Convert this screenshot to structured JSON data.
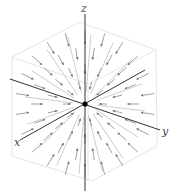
{
  "figure": {
    "type": "3d-vector-field",
    "colors": {
      "background": "#ffffff",
      "axis": "#333333",
      "box": "#dddddd",
      "arrow": "#777777",
      "origin": "#000000"
    },
    "axes": {
      "x": {
        "label": "x",
        "from": [
          145,
          70
        ],
        "to": [
          20,
          140
        ],
        "label_pos": [
          14,
          137
        ]
      },
      "y": {
        "label": "y",
        "from": [
          10,
          79
        ],
        "to": [
          160,
          130
        ],
        "label_pos": [
          162,
          126
        ]
      },
      "z": {
        "label": "z",
        "from": [
          85,
          191
        ],
        "to": [
          85,
          14
        ],
        "label_pos": [
          81,
          3
        ]
      }
    },
    "origin": [
      85,
      104
    ],
    "box": {
      "outer": [
        [
          12,
          57
        ],
        [
          80,
          22
        ],
        [
          156,
          50
        ],
        [
          157,
          146
        ],
        [
          92,
          181
        ],
        [
          12,
          156
        ]
      ],
      "inner_edges": [
        [
          [
            12,
            57
          ],
          [
            88,
            84
          ]
        ],
        [
          [
            88,
            84
          ],
          [
            156,
            50
          ]
        ],
        [
          [
            88,
            84
          ],
          [
            88,
            181
          ]
        ]
      ]
    }
  }
}
